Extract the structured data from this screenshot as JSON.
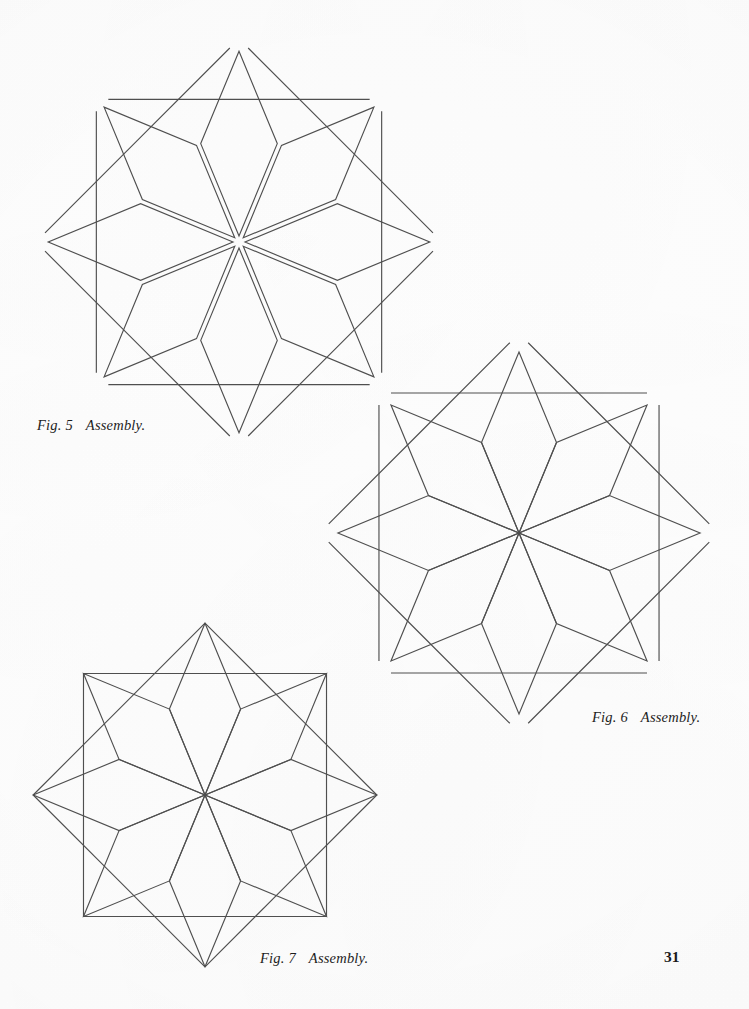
{
  "page": {
    "number": "31",
    "background_color": "#ffffff",
    "ink_color": "#4f4f4f",
    "text_color": "#1d1d1d"
  },
  "figures": [
    {
      "id": "fig-5",
      "caption_label": "Fig. 5",
      "caption_text": "Assembly.",
      "description": "Eight-pointed LeMoyne star quilt block, exploded assembly view: eight diamond points separated by seam gaps, four corner squares and four edge diamonds shown detached.",
      "center": {
        "x": 239,
        "y": 242
      },
      "pieces": {
        "star_diamonds": 8,
        "corner_squares": 4,
        "edge_diamonds": 4
      },
      "stage": "pieces separated"
    },
    {
      "id": "fig-6",
      "caption_label": "Fig. 6",
      "caption_text": "Assembly.",
      "description": "Eight-pointed star with all eight diamond points joined at the center; four corner squares and four edge diamonds still detached.",
      "center": {
        "x": 519,
        "y": 533
      },
      "pieces": {
        "star_diamonds": 8,
        "corner_squares": 4,
        "edge_diamonds": 4
      },
      "stage": "star joined, setting pieces detached"
    },
    {
      "id": "fig-7",
      "caption_label": "Fig. 7",
      "caption_text": "Assembly.",
      "description": "Completed eight-pointed star block with corner squares and edge diamonds set in, all seams joined.",
      "center": {
        "x": 205,
        "y": 795
      },
      "pieces": {
        "star_diamonds": 8,
        "corner_squares": 4,
        "edge_diamonds": 4
      },
      "stage": "block complete"
    }
  ],
  "chart_data": {
    "type": "diagram",
    "geometry": {
      "star_point_count": 8,
      "diamond_interior_angles_deg": [
        45,
        135,
        45,
        135
      ],
      "square_corner_pieces": 4,
      "edge_diamond_pieces": 4
    }
  }
}
